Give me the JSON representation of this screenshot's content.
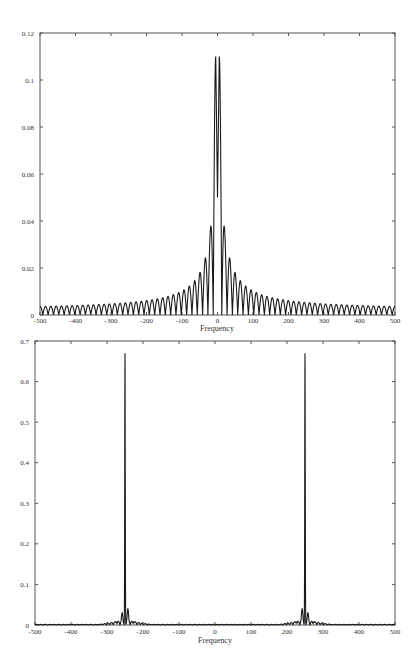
{
  "chart_data": [
    {
      "type": "line",
      "title": "",
      "xlabel": "Frequency",
      "ylabel": "",
      "xlim": [
        -500,
        500
      ],
      "ylim": [
        0,
        0.12
      ],
      "x_ticks": [
        -500,
        -400,
        -300,
        -200,
        -100,
        0,
        100,
        200,
        300,
        400,
        500
      ],
      "x_tick_labels": [
        "-500",
        "-400",
        "-300",
        "-200",
        "-100",
        "0",
        "100",
        "200",
        "300",
        "400",
        "500"
      ],
      "y_ticks": [
        0,
        0.02,
        0.04,
        0.06,
        0.08,
        0.1,
        0.12
      ],
      "y_tick_labels": [
        "0",
        "0.02",
        "0.04",
        "0.06",
        "0.08",
        "0.1",
        "0.12"
      ],
      "grid": false,
      "legend": null,
      "description": "Magnitude spectrum of a windowed sinusoid pair: two tall central peaks near +/-5 reaching ~0.11 with a dip to ~0.05 at 0, surrounded by decaying sidelobes (~0.032 at +/-25, ~0.023 at +/-40, ~0.017 at +/-55, tapering to ~0.003 at +/-500); lobe spacing ~15 Hz",
      "series": [
        {
          "name": "spectrum",
          "peaks": [
            {
              "x": -5,
              "y": 0.11
            },
            {
              "x": 5,
              "y": 0.11
            },
            {
              "x": 0,
              "y": 0.05,
              "note": "central dip"
            },
            {
              "x": -25,
              "y": 0.032
            },
            {
              "x": 25,
              "y": 0.032
            },
            {
              "x": -40,
              "y": 0.023
            },
            {
              "x": 40,
              "y": 0.023
            },
            {
              "x": -55,
              "y": 0.017
            },
            {
              "x": 55,
              "y": 0.017
            },
            {
              "x": -70,
              "y": 0.014
            },
            {
              "x": 70,
              "y": 0.014
            },
            {
              "x": -100,
              "y": 0.01
            },
            {
              "x": 100,
              "y": 0.01
            },
            {
              "x": -200,
              "y": 0.006
            },
            {
              "x": 200,
              "y": 0.006
            },
            {
              "x": -300,
              "y": 0.004
            },
            {
              "x": 300,
              "y": 0.004
            },
            {
              "x": -400,
              "y": 0.0035
            },
            {
              "x": 400,
              "y": 0.0035
            },
            {
              "x": -490,
              "y": 0.003
            },
            {
              "x": 490,
              "y": 0.003
            }
          ]
        }
      ]
    },
    {
      "type": "line",
      "title": "",
      "xlabel": "Frequency",
      "ylabel": "",
      "xlim": [
        -500,
        500
      ],
      "ylim": [
        0,
        0.7
      ],
      "x_ticks": [
        -500,
        -400,
        -300,
        -200,
        -100,
        0,
        100,
        200,
        300,
        400,
        500
      ],
      "x_tick_labels": [
        "-500",
        "-400",
        "-300",
        "-200",
        "-100",
        "0",
        "100",
        "200",
        "300",
        "400",
        "500"
      ],
      "y_ticks": [
        0,
        0.1,
        0.2,
        0.3,
        0.4,
        0.5,
        0.6,
        0.7
      ],
      "y_tick_labels": [
        "0",
        "0.1",
        "0.2",
        "0.3",
        "0.4",
        "0.5",
        "0.6",
        "0.7"
      ],
      "grid": false,
      "legend": null,
      "description": "Spectrum with two sharp symmetric peaks at about -250 and +250 reaching ~0.67, with small side bumps (~0.03-0.04) adjacent and near-zero elsewhere",
      "series": [
        {
          "name": "spectrum",
          "peaks": [
            {
              "x": -250,
              "y": 0.67
            },
            {
              "x": 250,
              "y": 0.67
            },
            {
              "x": -258,
              "y": 0.03
            },
            {
              "x": -242,
              "y": 0.04
            },
            {
              "x": 242,
              "y": 0.04
            },
            {
              "x": 258,
              "y": 0.03
            },
            {
              "x": -275,
              "y": 0.008
            },
            {
              "x": -225,
              "y": 0.008
            },
            {
              "x": 225,
              "y": 0.008
            },
            {
              "x": 275,
              "y": 0.008
            }
          ]
        }
      ]
    }
  ],
  "charts": {
    "top": {
      "xlabel": "Frequency",
      "x_tick_labels": [
        "-500",
        "-400",
        "-300",
        "-200",
        "-100",
        "0",
        "100",
        "200",
        "300",
        "400",
        "500"
      ],
      "y_tick_labels": [
        "0",
        "0.02",
        "0.04",
        "0.06",
        "0.08",
        "0.1",
        "0.12"
      ]
    },
    "bottom": {
      "xlabel": "Frequency",
      "x_tick_labels": [
        "-500",
        "-400",
        "-300",
        "-200",
        "-100",
        "0",
        "100",
        "200",
        "300",
        "400",
        "500"
      ],
      "y_tick_labels": [
        "0",
        "0.1",
        "0.2",
        "0.3",
        "0.4",
        "0.5",
        "0.6",
        "0.7"
      ]
    }
  },
  "colors": {
    "axis": "#555555",
    "line": "#1a1a1a",
    "background": "#ffffff"
  }
}
